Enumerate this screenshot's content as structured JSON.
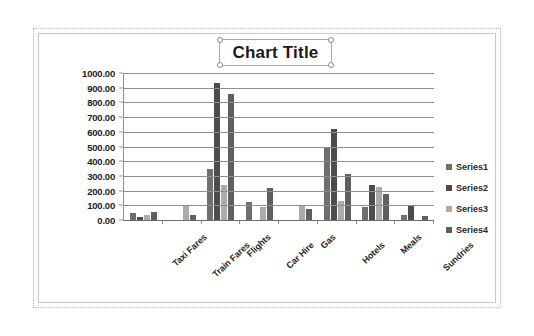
{
  "chart_object": {
    "selected": true,
    "handles": [
      "top-left",
      "top-center",
      "top-right",
      "middle-left",
      "middle-right",
      "bottom-left",
      "bottom-center",
      "bottom-right"
    ]
  },
  "title": {
    "text": "Chart Title",
    "selected": true
  },
  "colors": {
    "series1": "#6e6e6e",
    "series2": "#4c4c4c",
    "series3": "#ababab",
    "series4": "#5f5f5f",
    "gridline": "#8e8e8e",
    "axis": "#6d6d6d",
    "chart_border": "#c8c8c8",
    "plot_background": "#ffffff"
  },
  "chart_data": {
    "type": "bar",
    "title": "Chart Title",
    "xlabel": "",
    "ylabel": "",
    "ylim": [
      0,
      1000
    ],
    "ytick_step": 100,
    "ytick_labels": [
      "1000.00",
      "900.00",
      "800.00",
      "700.00",
      "600.00",
      "500.00",
      "400.00",
      "300.00",
      "200.00",
      "100.00",
      "0.00"
    ],
    "ytick_values": [
      1000,
      900,
      800,
      700,
      600,
      500,
      400,
      300,
      200,
      100,
      0
    ],
    "grid": true,
    "legend_position": "right",
    "categories": [
      "Taxi Fares",
      "Train Fares",
      "Flights",
      "Car Hire",
      "Gas",
      "Hotels",
      "Meals",
      "Sundries"
    ],
    "series": [
      {
        "name": "Series1",
        "color": "#6e6e6e",
        "values": [
          45,
          0,
          350,
          120,
          0,
          500,
          90,
          35
        ]
      },
      {
        "name": "Series2",
        "color": "#4c4c4c",
        "values": [
          20,
          0,
          930,
          0,
          0,
          620,
          235,
          105
        ]
      },
      {
        "name": "Series3",
        "color": "#ababab",
        "values": [
          35,
          100,
          240,
          90,
          100,
          130,
          225,
          0
        ]
      },
      {
        "name": "Series4",
        "color": "#5f5f5f",
        "values": [
          55,
          35,
          855,
          220,
          75,
          310,
          175,
          25
        ]
      }
    ]
  },
  "legend": {
    "items": [
      {
        "label": "Series1",
        "color": "#6e6e6e"
      },
      {
        "label": "Series2",
        "color": "#4c4c4c"
      },
      {
        "label": "Series3",
        "color": "#ababab"
      },
      {
        "label": "Series4",
        "color": "#5f5f5f"
      }
    ]
  }
}
